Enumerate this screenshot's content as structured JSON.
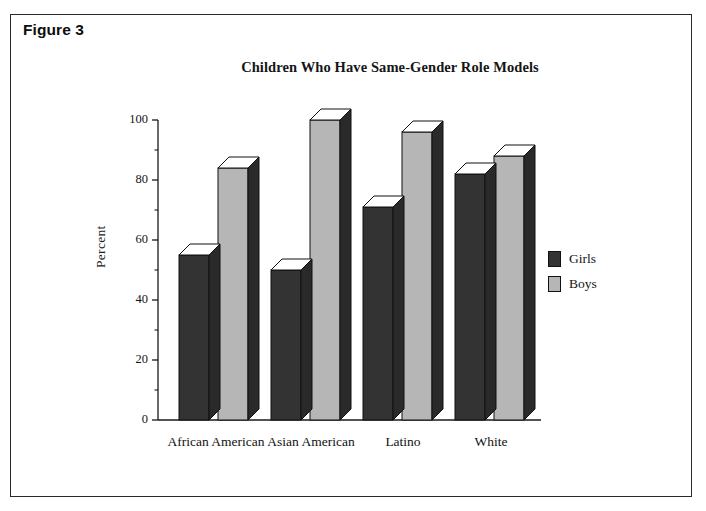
{
  "figure": {
    "label": "Figure 3"
  },
  "chart_data": {
    "type": "bar",
    "title": "Children Who Have Same-Gender Role Models",
    "xlabel": "",
    "ylabel": "Percent",
    "categories": [
      "African American",
      "Asian American",
      "Latino",
      "White"
    ],
    "series": [
      {
        "name": "Girls",
        "values": [
          55,
          50,
          71,
          82
        ],
        "color": "#333333"
      },
      {
        "name": "Boys",
        "values": [
          84,
          100,
          96,
          88
        ],
        "color": "#b6b6b6"
      }
    ],
    "ylim": [
      0,
      100
    ],
    "yticks": [
      0,
      20,
      40,
      60,
      80,
      100
    ],
    "ytick_labels": [
      "0",
      "20",
      "40",
      "60",
      "80",
      "100"
    ],
    "minor_ticks": [
      10,
      30,
      50,
      70,
      90
    ],
    "grid": false,
    "legend_position": "right",
    "style": "3d-bar"
  },
  "legend": {
    "items": [
      {
        "label": "Girls",
        "swatch": "dark"
      },
      {
        "label": "Boys",
        "swatch": "light"
      }
    ]
  }
}
